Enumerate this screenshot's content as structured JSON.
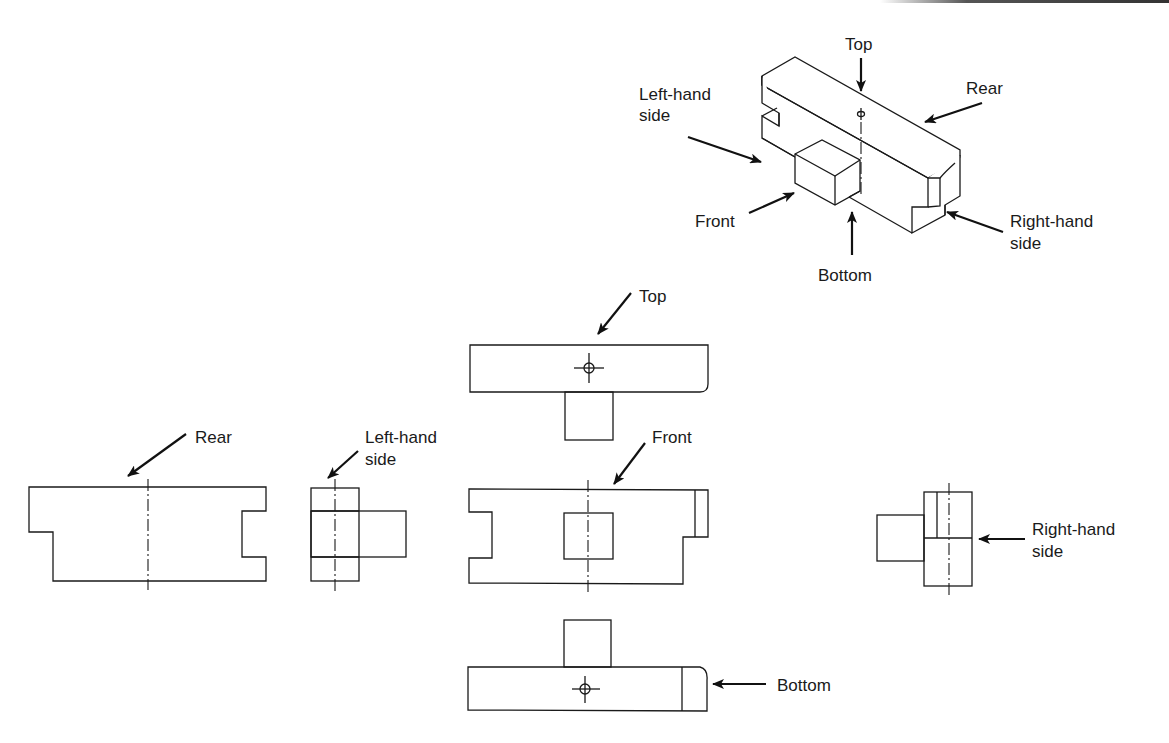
{
  "figure": {
    "type": "orthographic-projection-diagram",
    "colors": {
      "line": "#1a1a1a",
      "background": "#ffffff"
    },
    "isometric_view": {
      "labels": {
        "top": "Top",
        "left_hand_side_1": "Left-hand",
        "left_hand_side_2": "side",
        "rear": "Rear",
        "front": "Front",
        "bottom": "Bottom",
        "right_hand_side_1": "Right-hand",
        "right_hand_side_2": "side"
      }
    },
    "views": {
      "top": {
        "label": "Top"
      },
      "rear": {
        "label": "Rear"
      },
      "left_hand_side": {
        "label_1": "Left-hand",
        "label_2": "side"
      },
      "front": {
        "label": "Front"
      },
      "right_hand_side": {
        "label_1": "Right-hand",
        "label_2": "side"
      },
      "bottom": {
        "label": "Bottom"
      }
    }
  }
}
